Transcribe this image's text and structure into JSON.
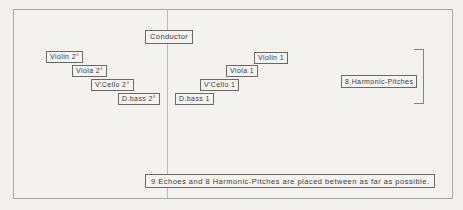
{
  "colors": {
    "paper": "#f2f1ed",
    "frame_line": "#a8a7a2",
    "box_border": "#6a6964",
    "text": "#3c3b37",
    "center_line": "#bdbcb8"
  },
  "stage": {
    "conductor_label": "Conductor",
    "orchestra_2": [
      {
        "label": "Violin 2°"
      },
      {
        "label": "Viola 2°"
      },
      {
        "label": "V'Cello 2°"
      },
      {
        "label": "D.bass 2°"
      }
    ],
    "orchestra_1": [
      {
        "label": "Violin 1"
      },
      {
        "label": "Viola 1"
      },
      {
        "label": "V'Cello 1"
      },
      {
        "label": "D.bass 1"
      }
    ],
    "harmonic_pitches_label": "8 Harmonic-Pitches",
    "caption": "9 Echoes and 8 Harmonic-Pitches are placed between as far as possible."
  }
}
